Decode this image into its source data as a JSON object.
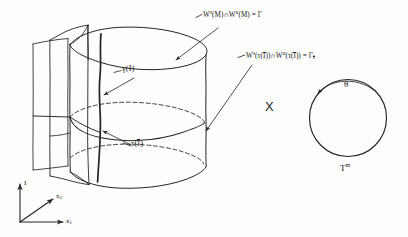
{
  "figure": {
    "background_color": "#fdfdfc",
    "ink_color": "#232323"
  },
  "labels": {
    "manifold_intersection": {
      "w_letter": "W",
      "sup_stable": "s",
      "open_paren_m": "(M)",
      "cap": "∩",
      "w_letter2": "W",
      "sup_unstable": "u",
      "open_paren_m2": "(M)",
      "equals": "=",
      "gamma": "Γ"
    },
    "manifold_intersection_tau": {
      "w_letter": "W",
      "sup_stable": "s",
      "tau_arg": "(τ(",
      "ibar": "I",
      "close1": "))",
      "cap": "∩",
      "w_letter2": "W",
      "sup_unstable": "u",
      "tau_arg2": "(τ(",
      "ibar2": "I",
      "close2": "))",
      "equals": "=",
      "gamma": "Γ",
      "gamma_sub": "I"
    },
    "gamma_I": "γ(I)",
    "tau_Ibar_prefix": "τ(",
    "tau_Ibar_bar": "I",
    "tau_Ibar_suffix": ")",
    "theta": "θ",
    "torus_letter": "T",
    "torus_sup": "m",
    "product_symbol": "X"
  },
  "axes": {
    "vertical": "I",
    "diagonal_letter": "x",
    "diagonal_sub": "2",
    "horizontal_letter": "x",
    "horizontal_sub": "1"
  }
}
